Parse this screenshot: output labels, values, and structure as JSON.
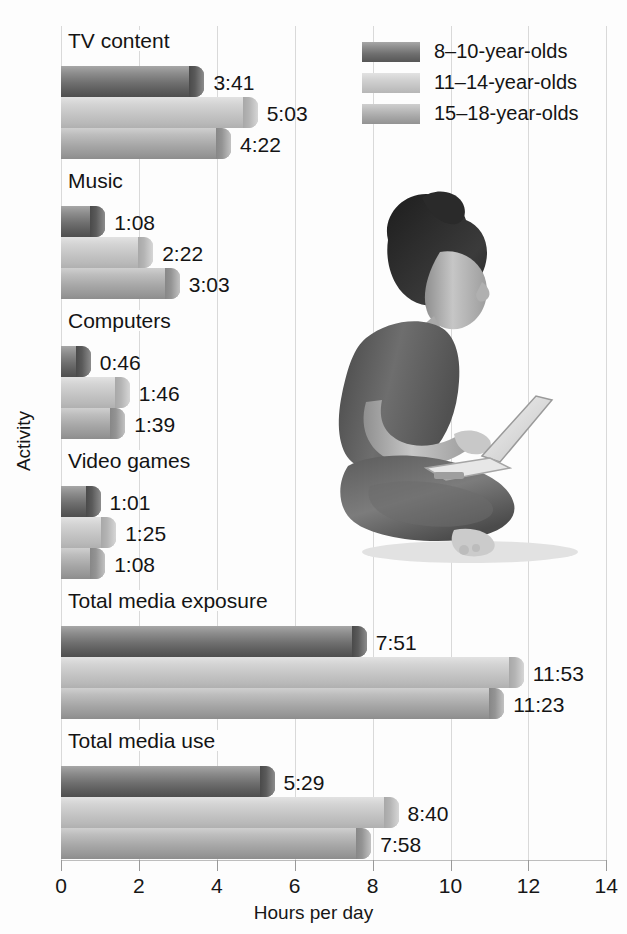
{
  "chart_data": {
    "type": "bar",
    "orientation": "horizontal",
    "title": "",
    "xlabel": "Hours per day",
    "ylabel": "Activity",
    "xlim": [
      0,
      14
    ],
    "xticks": [
      0,
      2,
      4,
      6,
      8,
      10,
      12,
      14
    ],
    "xtick_labels": [
      "0",
      "2",
      "4",
      "6",
      "8",
      "10",
      "12",
      "14"
    ],
    "grid": true,
    "grid_axis": "x",
    "legend_position": "top-right",
    "categories": [
      "TV content",
      "Music",
      "Computers",
      "Video games",
      "Total media exposure",
      "Total media use"
    ],
    "series": [
      {
        "name": "8–10-year-olds",
        "color": "#6f6f6f",
        "labels": [
          "3:41",
          "1:08",
          "0:46",
          "1:01",
          "7:51",
          "5:29"
        ],
        "values": [
          3.683,
          1.133,
          0.767,
          1.017,
          7.85,
          5.483
        ]
      },
      {
        "name": "11–14-year-olds",
        "color": "#c6c6c6",
        "labels": [
          "5:03",
          "2:22",
          "1:46",
          "1:25",
          "11:53",
          "8:40"
        ],
        "values": [
          5.05,
          2.367,
          1.767,
          1.417,
          11.883,
          8.667
        ]
      },
      {
        "name": "15–18-year-olds",
        "color": "#a6a6a6",
        "labels": [
          "4:22",
          "3:03",
          "1:39",
          "1:08",
          "11:23",
          "7:58"
        ],
        "values": [
          4.367,
          3.05,
          1.65,
          1.133,
          11.383,
          7.967
        ]
      }
    ]
  },
  "legend": {
    "items": [
      {
        "label": "8–10-year-olds"
      },
      {
        "label": "11–14-year-olds"
      },
      {
        "label": "15–18-year-olds"
      }
    ]
  },
  "axes": {
    "x_title": "Hours per day",
    "y_title": "Activity",
    "x_tick_labels": [
      "0",
      "2",
      "4",
      "6",
      "8",
      "10",
      "12",
      "14"
    ]
  },
  "photo": {
    "alt": "Woman sitting cross-legged on the floor using a laptop"
  }
}
